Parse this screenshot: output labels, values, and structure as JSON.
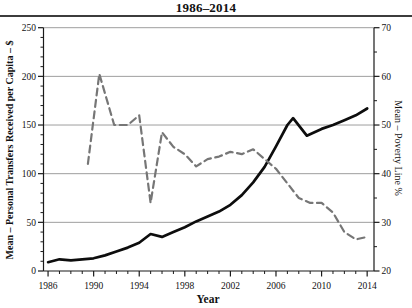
{
  "chart_data": {
    "type": "line",
    "title": "1986–2014",
    "xlabel": "Year",
    "grid": "horizontal-major",
    "legend": "none",
    "x_range": [
      1985.6,
      2014.6
    ],
    "x_major_ticks": [
      1986,
      1990,
      1994,
      1998,
      2002,
      2006,
      2010,
      2014
    ],
    "x_minor_step": 1,
    "left_axis": {
      "label": "Mean – Personal Transfers Received per Capita – $",
      "range": [
        0,
        250
      ],
      "major_ticks": [
        0,
        50,
        100,
        150,
        200,
        250
      ],
      "minor_step": 10
    },
    "right_axis": {
      "label": "Mean – Poverty Line %",
      "range": [
        20,
        70
      ],
      "major_ticks": [
        20,
        30,
        40,
        50,
        60,
        70
      ],
      "minor_step": 5
    },
    "series": [
      {
        "name": "personal-transfers-received-per-capita",
        "axis": "left",
        "style": "dashed-none",
        "color": "#0d0d0d",
        "width": 2.7,
        "points": [
          [
            1986,
            9
          ],
          [
            1987,
            12
          ],
          [
            1988,
            11
          ],
          [
            1989,
            12
          ],
          [
            1990,
            13
          ],
          [
            1991,
            16
          ],
          [
            1992,
            20
          ],
          [
            1993,
            24
          ],
          [
            1994,
            29
          ],
          [
            1995,
            38
          ],
          [
            1996,
            35
          ],
          [
            1997,
            40
          ],
          [
            1998,
            45
          ],
          [
            1999,
            51
          ],
          [
            2000,
            56
          ],
          [
            2001,
            61
          ],
          [
            2002,
            68
          ],
          [
            2003,
            78
          ],
          [
            2004,
            91
          ],
          [
            2005,
            107
          ],
          [
            2006,
            128
          ],
          [
            2007,
            150
          ],
          [
            2007.5,
            157
          ],
          [
            2008.7,
            139
          ],
          [
            2010,
            146
          ],
          [
            2011,
            150
          ],
          [
            2012,
            155
          ],
          [
            2013,
            160
          ],
          [
            2014,
            167
          ]
        ]
      },
      {
        "name": "poverty-line-percent",
        "axis": "right",
        "style": "dashed",
        "color": "#767676",
        "width": 2.2,
        "dash": [
          7,
          4.5
        ],
        "points": [
          [
            1989.5,
            42
          ],
          [
            1990.5,
            60.5
          ],
          [
            1991.8,
            50
          ],
          [
            1993,
            50
          ],
          [
            1994,
            52
          ],
          [
            1995,
            34
          ],
          [
            1996,
            48.5
          ],
          [
            1997,
            45.5
          ],
          [
            1998,
            44
          ],
          [
            1999,
            41.5
          ],
          [
            2000,
            43
          ],
          [
            2001,
            43.5
          ],
          [
            2002,
            44.5
          ],
          [
            2003,
            44
          ],
          [
            2004,
            45
          ],
          [
            2005,
            43
          ],
          [
            2006,
            41
          ],
          [
            2007,
            38
          ],
          [
            2008,
            35
          ],
          [
            2009,
            34
          ],
          [
            2010,
            34
          ],
          [
            2011,
            32
          ],
          [
            2012,
            28
          ],
          [
            2013,
            26.5
          ],
          [
            2014,
            27
          ]
        ]
      }
    ],
    "colors": {
      "gridline": "#9e9e9e",
      "axis": "#1a1a1a",
      "text": "#111111",
      "background": "#ffffff"
    }
  }
}
